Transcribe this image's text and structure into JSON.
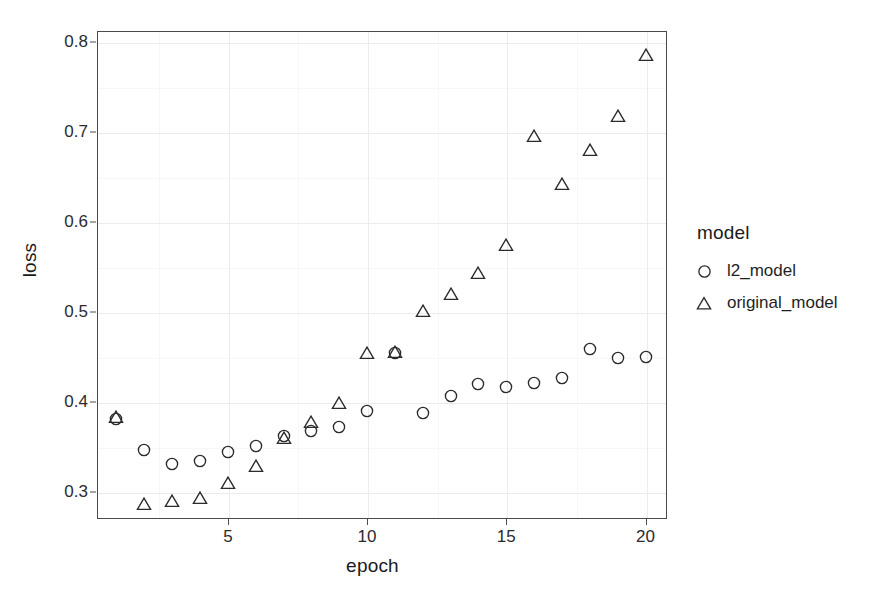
{
  "chart_data": {
    "type": "scatter",
    "title": "",
    "xlabel": "epoch",
    "ylabel": "loss",
    "xlim": [
      0.3,
      20.7
    ],
    "ylim": [
      0.272,
      0.812
    ],
    "xticks": [
      5,
      10,
      15,
      20
    ],
    "xtick_labels": [
      "5",
      "10",
      "15",
      "20"
    ],
    "yticks": [
      0.3,
      0.4,
      0.5,
      0.6,
      0.7,
      0.8
    ],
    "ytick_labels": [
      "0.3",
      "0.4",
      "0.5",
      "0.6",
      "0.7",
      "0.8"
    ],
    "yticks_minor": [
      0.35,
      0.45,
      0.55,
      0.65,
      0.75
    ],
    "xticks_minor": [
      2.5,
      7.5,
      12.5,
      17.5
    ],
    "grid": true,
    "legend_position": "right",
    "legend_title": "model",
    "x": [
      1,
      2,
      3,
      4,
      5,
      6,
      7,
      8,
      9,
      10,
      11,
      12,
      13,
      14,
      15,
      16,
      17,
      18,
      19,
      20
    ],
    "series": [
      {
        "name": "l2_model",
        "marker": "circle",
        "color": "#2b2b2b",
        "values": [
          0.381,
          0.346,
          0.331,
          0.334,
          0.344,
          0.351,
          0.362,
          0.368,
          0.372,
          0.39,
          0.454,
          0.388,
          0.406,
          0.42,
          0.416,
          0.421,
          0.426,
          0.459,
          0.449,
          0.45
        ]
      },
      {
        "name": "original_model",
        "marker": "triangle",
        "color": "#2b2b2b",
        "values": [
          0.385,
          0.288,
          0.292,
          0.295,
          0.312,
          0.33,
          0.361,
          0.379,
          0.4,
          0.456,
          0.457,
          0.503,
          0.521,
          0.545,
          0.576,
          0.697,
          0.644,
          0.681,
          0.719,
          0.787
        ]
      }
    ]
  },
  "legend": {
    "title": "model",
    "entries": [
      {
        "label": "l2_model",
        "marker": "circle"
      },
      {
        "label": "original_model",
        "marker": "triangle"
      }
    ]
  },
  "axes": {
    "x_title": "epoch",
    "y_title": "loss"
  }
}
